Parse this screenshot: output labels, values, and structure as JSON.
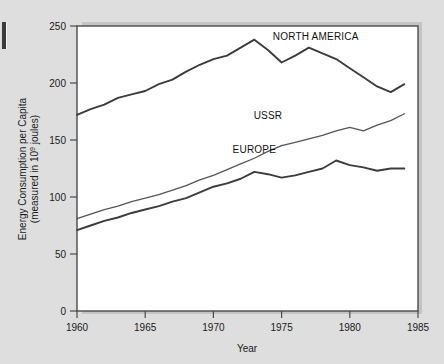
{
  "figure": {
    "background_color": "#dedede",
    "plot_background_color": "#ffffff",
    "frame_color": "#4a4a4a",
    "edge_mark": "left-edge-mark"
  },
  "chart_data": {
    "type": "line",
    "title": "",
    "xlabel": "Year",
    "ylabel": "Energy Consumption per Capita (measured in 10^9 joules)",
    "ylabel_line1": "Energy Consumption per Capita",
    "ylabel_line2_prefix": "(measured in 10",
    "ylabel_line2_sup": "9",
    "ylabel_line2_suffix": " joules)",
    "xlim": [
      1960,
      1985
    ],
    "ylim": [
      0,
      250
    ],
    "xticks": [
      1960,
      1965,
      1970,
      1975,
      1980,
      1985
    ],
    "xtick_labels": [
      "1960",
      "1965",
      "1970",
      "1975",
      "1980",
      "1985"
    ],
    "yticks": [
      0,
      50,
      100,
      150,
      200,
      250
    ],
    "ytick_labels": [
      "0",
      "50",
      "100",
      "150",
      "200",
      "250"
    ],
    "grid": false,
    "legend": "inline-labels",
    "x": [
      1960,
      1961,
      1962,
      1963,
      1964,
      1965,
      1966,
      1967,
      1968,
      1969,
      1970,
      1971,
      1972,
      1973,
      1974,
      1975,
      1976,
      1977,
      1978,
      1979,
      1980,
      1981,
      1982,
      1983,
      1984
    ],
    "series": [
      {
        "name": "NORTH AMERICA",
        "color": "#3c3c3c",
        "label_x": 1977.5,
        "label_y": 238,
        "values": [
          172,
          177,
          181,
          187,
          190,
          193,
          199,
          203,
          210,
          216,
          221,
          224,
          231,
          238,
          229,
          218,
          224,
          231,
          226,
          221,
          213,
          205,
          197,
          192,
          199
        ]
      },
      {
        "name": "USSR",
        "color": "#555555",
        "label_x": 1974.0,
        "label_y": 168,
        "values": [
          81,
          85,
          89,
          92,
          96,
          99,
          102,
          106,
          110,
          115,
          119,
          124,
          129,
          134,
          140,
          145,
          148,
          151,
          154,
          158,
          161,
          158,
          163,
          167,
          173
        ]
      },
      {
        "name": "EUROPE",
        "color": "#3c3c3c",
        "label_x": 1973.0,
        "label_y": 139,
        "values": [
          71,
          75,
          79,
          82,
          86,
          89,
          92,
          96,
          99,
          104,
          109,
          112,
          116,
          122,
          120,
          117,
          119,
          122,
          125,
          132,
          128,
          126,
          123,
          125,
          125
        ]
      }
    ]
  }
}
